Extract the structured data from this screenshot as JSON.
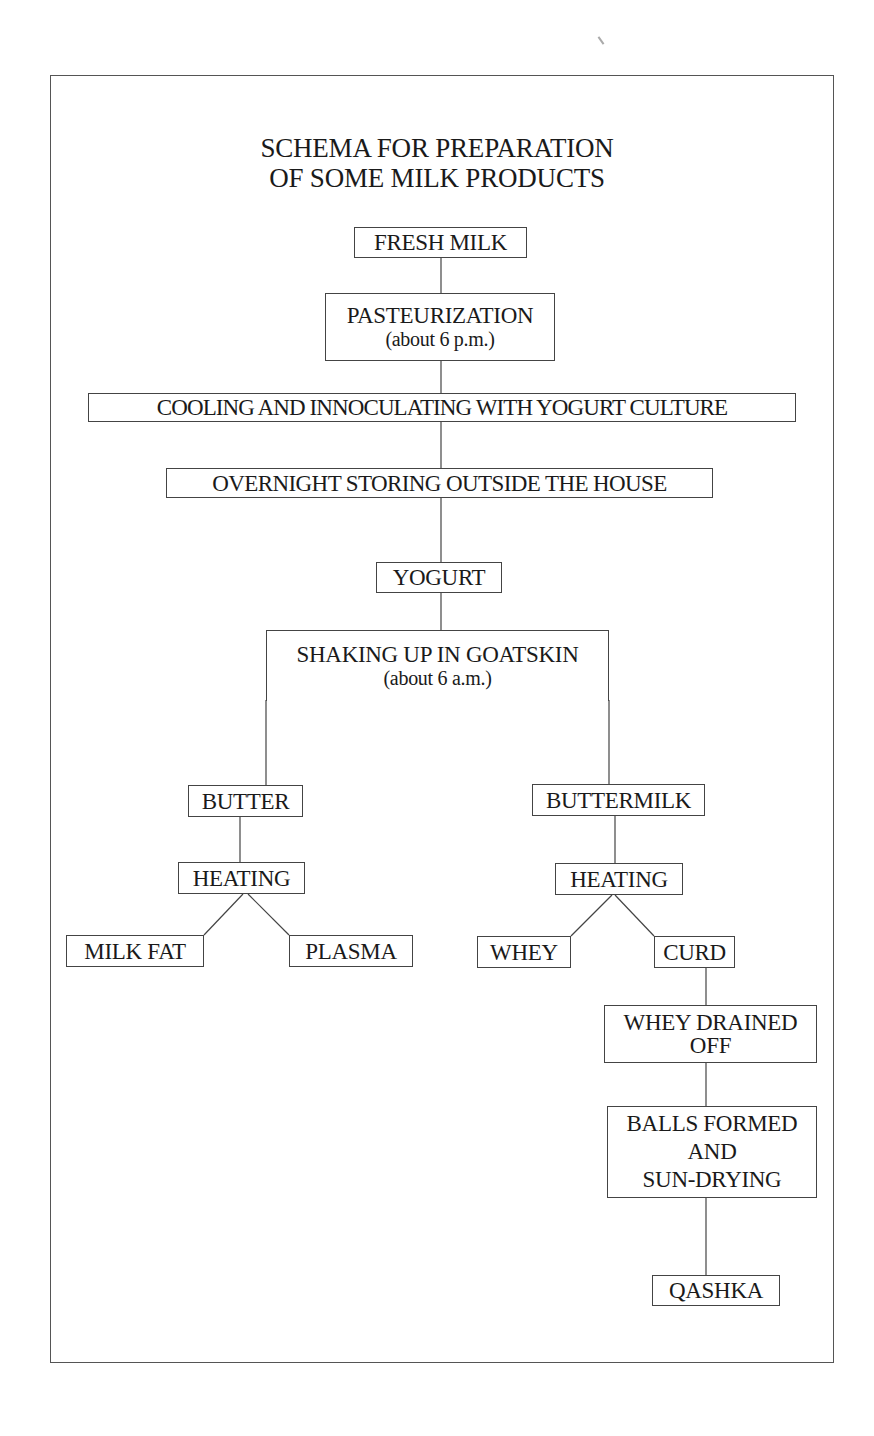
{
  "title": {
    "line1": "SCHEMA FOR PREPARATION",
    "line2": "OF SOME MILK PRODUCTS"
  },
  "nodes": {
    "fresh_milk": {
      "label": "FRESH MILK"
    },
    "pasteurization": {
      "label": "PASTEURIZATION",
      "note": "(about 6 p.m.)"
    },
    "cooling": {
      "label": "COOLING AND INNOCULATING WITH YOGURT CULTURE"
    },
    "overnight": {
      "label": "OVERNIGHT STORING OUTSIDE THE HOUSE"
    },
    "yogurt": {
      "label": "YOGURT"
    },
    "shaking": {
      "label": "SHAKING UP IN GOATSKIN",
      "note": "(about 6 a.m.)"
    },
    "butter": {
      "label": "BUTTER"
    },
    "buttermilk": {
      "label": "BUTTERMILK"
    },
    "heating_butter": {
      "label": "HEATING"
    },
    "heating_buttermilk": {
      "label": "HEATING"
    },
    "milk_fat": {
      "label": "MILK FAT"
    },
    "plasma": {
      "label": "PLASMA"
    },
    "whey": {
      "label": "WHEY"
    },
    "curd": {
      "label": "CURD"
    },
    "whey_drained": {
      "line1": "WHEY DRAINED",
      "line2": "OFF"
    },
    "balls": {
      "line1": "BALLS FORMED",
      "line2": "AND",
      "line3": "SUN-DRYING"
    },
    "qashka": {
      "label": "QASHKA"
    }
  },
  "edges": [
    [
      "fresh_milk",
      "pasteurization"
    ],
    [
      "pasteurization",
      "cooling"
    ],
    [
      "cooling",
      "overnight"
    ],
    [
      "overnight",
      "yogurt"
    ],
    [
      "yogurt",
      "shaking"
    ],
    [
      "shaking",
      "butter"
    ],
    [
      "shaking",
      "buttermilk"
    ],
    [
      "butter",
      "heating_butter"
    ],
    [
      "heating_butter",
      "milk_fat"
    ],
    [
      "heating_butter",
      "plasma"
    ],
    [
      "buttermilk",
      "heating_buttermilk"
    ],
    [
      "heating_buttermilk",
      "whey"
    ],
    [
      "heating_buttermilk",
      "curd"
    ],
    [
      "curd",
      "whey_drained"
    ],
    [
      "whey_drained",
      "balls"
    ],
    [
      "balls",
      "qashka"
    ]
  ],
  "colors": {
    "line": "#444444",
    "text": "#1a1a1a",
    "background": "#ffffff"
  }
}
